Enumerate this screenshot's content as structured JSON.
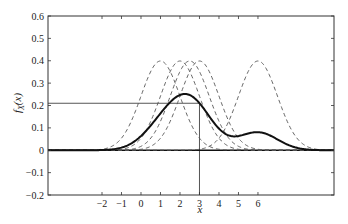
{
  "chart_data": {
    "type": "line",
    "title": "",
    "xlabel": "x",
    "ylabel": "f_X(x)",
    "xlim": [
      -4.77,
      9.9
    ],
    "ylim": [
      -0.2,
      0.6
    ],
    "grid": false,
    "legend": null,
    "x_ticks": [
      -2,
      -1,
      0,
      1,
      2,
      3,
      4,
      5,
      6
    ],
    "y_ticks": [
      -0.2,
      -0.1,
      0,
      0.1,
      0.2,
      0.3,
      0.4,
      0.5,
      0.6
    ],
    "x_tick_labels": [
      "−2",
      "−1",
      "0",
      "1",
      "2",
      "3",
      "4",
      "5",
      "6"
    ],
    "y_tick_labels": [
      "−0.2",
      "−0.1",
      "0",
      "0.1",
      "0.2",
      "0.3",
      "0.4",
      "0.5",
      "0.6"
    ],
    "series": [
      {
        "name": "component N(1,1)",
        "style": "dashed",
        "mean": 1,
        "sigma": 1,
        "weight": 1,
        "peak": 0.4
      },
      {
        "name": "component N(2,1)",
        "style": "dashed",
        "mean": 2,
        "sigma": 1,
        "weight": 1,
        "peak": 0.4
      },
      {
        "name": "component N(2.5,1)",
        "style": "dashed",
        "mean": 2.5,
        "sigma": 1,
        "weight": 1,
        "peak": 0.4
      },
      {
        "name": "component N(3,1)",
        "style": "dashed",
        "mean": 3,
        "sigma": 1,
        "weight": 1,
        "peak": 0.4
      },
      {
        "name": "component N(6,1)",
        "style": "dashed",
        "mean": 6,
        "sigma": 1,
        "weight": 1,
        "peak": 0.4
      },
      {
        "name": "mixture f_X(x)",
        "style": "solid-bold",
        "means": [
          1,
          2,
          2.5,
          3,
          6
        ],
        "sigma": 1,
        "weight": 0.2,
        "peak_x": 2.2,
        "peak_y": 0.25,
        "secondary_peak_x": 6,
        "secondary_peak_y": 0.08
      }
    ],
    "annotations": [
      {
        "type": "vline",
        "x": 3,
        "from_y": 0.21,
        "to_y": -0.2,
        "label": "x = 3"
      },
      {
        "type": "hline",
        "y": 0.21,
        "from_x": -4.77,
        "to_x": 3,
        "label": "f_X(3) ≈ 0.21"
      },
      {
        "type": "hline",
        "y": 0,
        "from_x": -4.77,
        "to_x": 9.9,
        "label": "zero line"
      }
    ]
  },
  "labels": {
    "xlabel": "x",
    "ylabel_main": "f",
    "ylabel_sub": "X",
    "ylabel_arg": "(x)"
  },
  "colors": {
    "axis": "#333333",
    "mixture": "#111111",
    "components": "#555555",
    "reference": "#555555"
  }
}
